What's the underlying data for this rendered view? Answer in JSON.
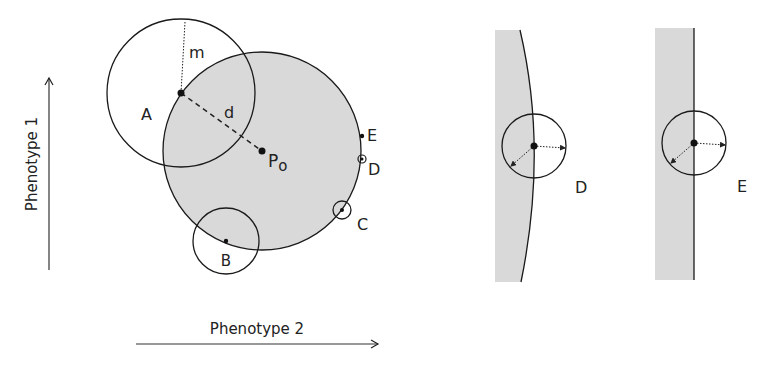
{
  "figure": {
    "axes": {
      "y_label": "Phenotype 1",
      "x_label": "Phenotype 2"
    },
    "main_panel": {
      "optimum_label": "P",
      "optimum_subscript": "o",
      "distance_label": "d",
      "mutation_size_label": "m",
      "points": {
        "A": "A",
        "B": "B",
        "C": "C",
        "D": "D",
        "E": "E"
      }
    },
    "zoom_panels": [
      {
        "label": "D"
      },
      {
        "label": "E"
      }
    ],
    "colors": {
      "fitness_region_fill": "#d9d9d9",
      "stroke": "#1a1a1a",
      "background": "#ffffff"
    }
  }
}
